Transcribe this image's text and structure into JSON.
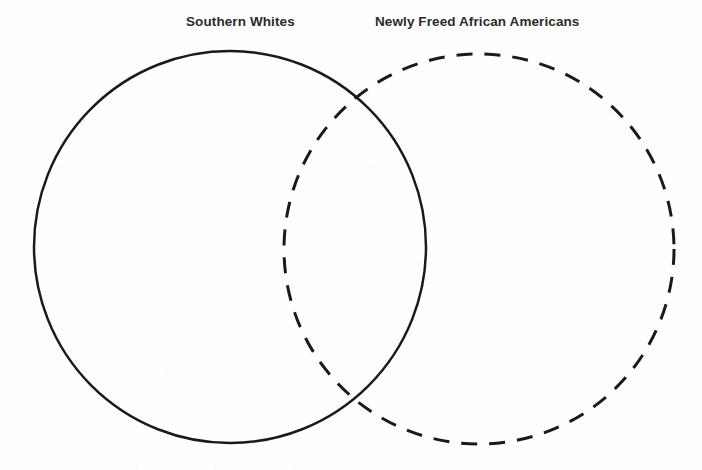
{
  "diagram": {
    "type": "venn-diagram",
    "set_count": 2,
    "background_color": "#fefefe",
    "stroke_color": "#1a1a1a",
    "label_color": "#2b2b2b",
    "sets": [
      {
        "id": "southern-whites",
        "label": "Southern Whites",
        "outline_style": "solid",
        "center_x": 230,
        "center_y": 247,
        "radius": 196,
        "stroke_width": 2.5,
        "label_x": 186,
        "label_y": 15,
        "contents": []
      },
      {
        "id": "newly-freed-african-americans",
        "label": "Newly Freed African Americans",
        "outline_style": "dashed",
        "dash_length": 16,
        "dash_gap": 12,
        "center_x": 479,
        "center_y": 249,
        "radius": 195,
        "stroke_width": 3,
        "label_x": 375,
        "label_y": 15,
        "contents": []
      }
    ],
    "overlap_region": {
      "id": "shared",
      "label": "",
      "contents": []
    }
  }
}
